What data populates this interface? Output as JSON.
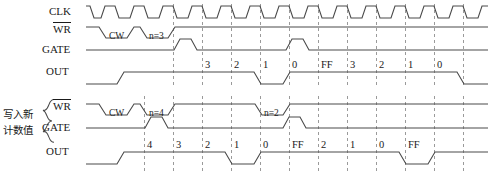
{
  "figure": {
    "type": "timing-diagram",
    "title_cn": "写入新计数值",
    "title_cn_line1": "写入新",
    "title_cn_line2": "计数值",
    "stroke_color": "#4a4a4a",
    "text_color": "#1a1a1a",
    "dash_color": "#9a9a9a"
  },
  "group1": {
    "rows": [
      {
        "name": "clk",
        "label": "CLK"
      },
      {
        "name": "wr",
        "label": "WR",
        "overbar": true
      },
      {
        "name": "gate",
        "label": "GATE"
      },
      {
        "name": "out",
        "label": "OUT"
      }
    ],
    "wr_pulse_labels": [
      "CW",
      "n=3"
    ],
    "out_values": [
      "3",
      "2",
      "1",
      "0",
      "FF",
      "3",
      "2",
      "1",
      "0"
    ]
  },
  "group2": {
    "rows": [
      {
        "name": "wr",
        "label": "WR",
        "overbar": true
      },
      {
        "name": "gate",
        "label": "GATE"
      },
      {
        "name": "out",
        "label": "OUT"
      }
    ],
    "wr_pulse_labels": [
      "CW",
      "n=4",
      "n=2"
    ],
    "out_values": [
      "4",
      "3",
      "2",
      "1",
      "0",
      "FF",
      "2",
      "1",
      "0",
      "FF"
    ]
  },
  "clock": {
    "cycles": 14,
    "period_px": 29
  }
}
